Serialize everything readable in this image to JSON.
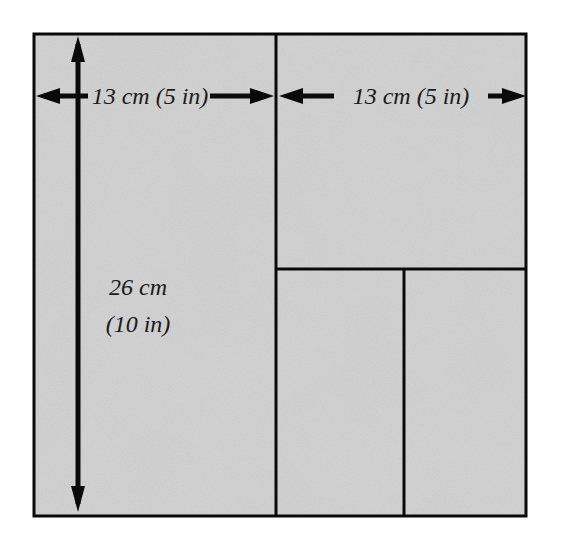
{
  "diagram": {
    "type": "cutting-layout",
    "colors": {
      "paper_fill": "#c9c9c9",
      "line": "#0a0a0a",
      "text": "#1a1a1a",
      "background": "#ffffff"
    },
    "outer_square": {
      "x": 33,
      "y": 33,
      "width": 494,
      "height": 484
    },
    "pieces": [
      {
        "name": "left-panel",
        "x": 33,
        "y": 33,
        "width": 243,
        "height": 484
      },
      {
        "name": "top-right-square",
        "x": 276,
        "y": 33,
        "width": 251,
        "height": 236
      },
      {
        "name": "bottom-right-left-rect",
        "x": 276,
        "y": 269,
        "width": 128,
        "height": 248
      },
      {
        "name": "bottom-right-right-rect",
        "x": 404,
        "y": 269,
        "width": 123,
        "height": 248
      }
    ],
    "labels": {
      "width_left": "13 cm (5 in)",
      "width_right": "13 cm (5 in)",
      "height_line1": "26 cm",
      "height_line2": "(10 in)"
    },
    "arrows": {
      "horizontal_left": {
        "y": 96,
        "x1": 35,
        "x2": 274
      },
      "horizontal_right": {
        "y": 96,
        "x1": 278,
        "x2": 525
      },
      "vertical": {
        "x": 78,
        "y1": 36,
        "y2": 512
      }
    }
  }
}
